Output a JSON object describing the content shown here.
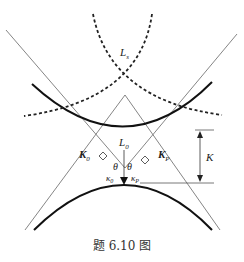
{
  "figure": {
    "caption": "题 6.10 图",
    "labels": {
      "L_s": "L",
      "L_s_sub": "s",
      "L_0": "L",
      "L_0_sub": "0",
      "K0_vec": "K",
      "K0_vec_sub": "0",
      "KP_vec": "K",
      "KP_vec_sub": "P",
      "K_distance": "K",
      "theta_left": "θ",
      "theta_right": "θ",
      "kappa0": "κ",
      "kappa0_sub": "0",
      "kappaP": "κ",
      "kappaP_sub": "P"
    },
    "colors": {
      "line": "#555555",
      "curve": "#111111"
    }
  }
}
